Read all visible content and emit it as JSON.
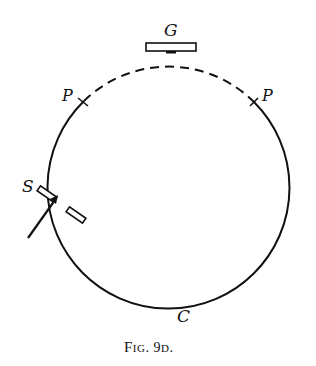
{
  "figure": {
    "caption_main": "Fig. 9",
    "caption_sub": "D",
    "caption_end": ".",
    "caption_display": "FIG. 9D."
  },
  "labels": {
    "grating": "G",
    "point_left": "P",
    "point_right": "P",
    "slit": "S",
    "circle": "C"
  },
  "geometry": {
    "circle_center": [
      177,
      173
    ],
    "circle_radius": 121,
    "dashed_arc": "between the two P marks, across the top under grating G",
    "solid_arc": "remainder of circle through S and C"
  },
  "colors": {
    "ink": "#111111",
    "background": "#ffffff"
  }
}
